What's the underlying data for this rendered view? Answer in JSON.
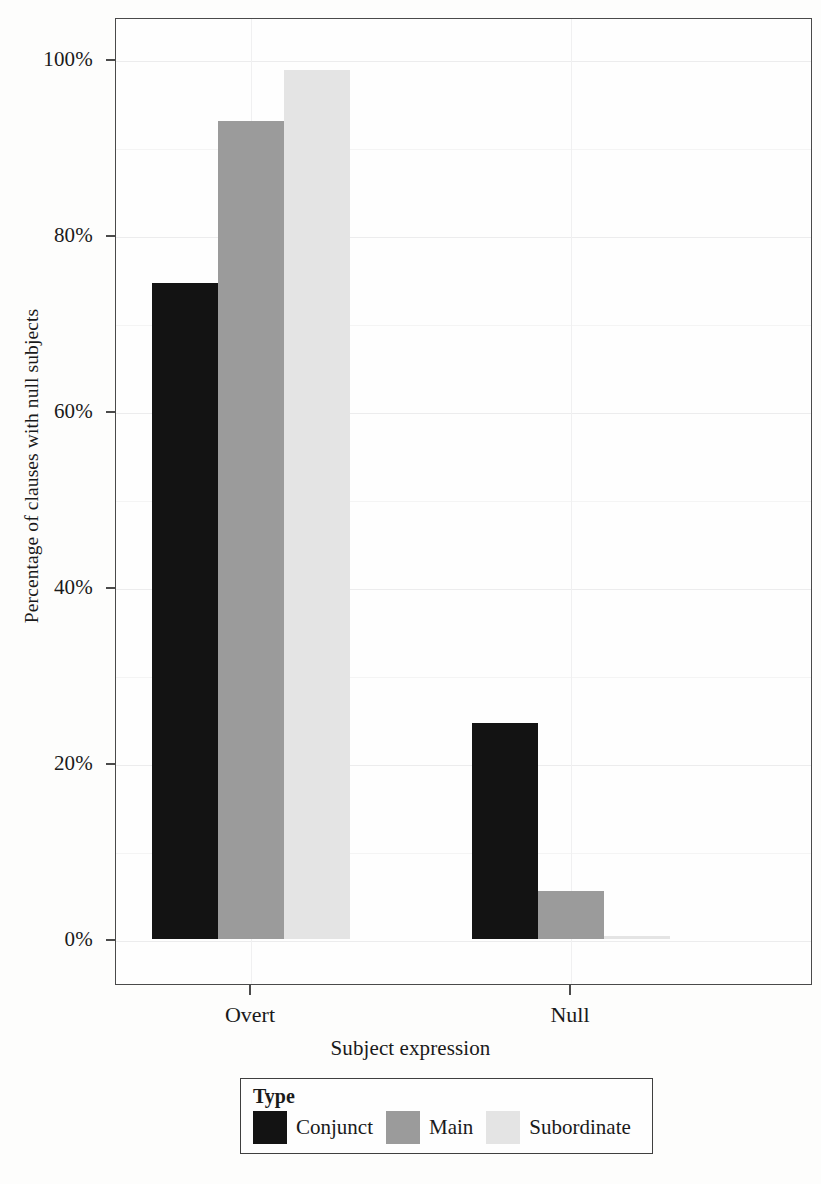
{
  "chart_data": {
    "type": "bar",
    "title": "",
    "xlabel": "Subject expression",
    "ylabel": "Percentage of clauses with null subjects",
    "categories": [
      "Overt",
      "Null"
    ],
    "series": [
      {
        "name": "Conjunct",
        "color": "#131313",
        "values": [
          74.5,
          24.5
        ]
      },
      {
        "name": "Main",
        "color": "#9b9b9b",
        "values": [
          93.0,
          5.4
        ]
      },
      {
        "name": "Subordinate",
        "color": "#e4e4e4",
        "values": [
          98.8,
          0.3
        ]
      }
    ],
    "ylim": [
      0,
      104
    ],
    "yticks": [
      0,
      20,
      40,
      60,
      80,
      100
    ],
    "ytick_labels": [
      "0%",
      "20%",
      "40%",
      "60%",
      "80%",
      "100%"
    ],
    "minor_yticks": [
      10,
      30,
      50,
      70,
      90
    ],
    "grid": true,
    "legend": {
      "title": "Type",
      "position": "bottom",
      "entries": [
        "Conjunct",
        "Main",
        "Subordinate"
      ]
    }
  }
}
